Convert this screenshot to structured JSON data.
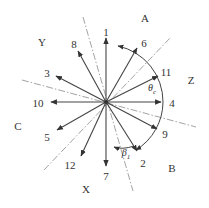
{
  "diagram": {
    "center": [
      106,
      102
    ],
    "colors": {
      "arrow": "#444444",
      "dash": "#999999",
      "text": "#333333"
    },
    "regions": [
      {
        "label": "A",
        "x": 145,
        "y": 18
      },
      {
        "label": "Y",
        "x": 42,
        "y": 42
      },
      {
        "label": "Z",
        "x": 191,
        "y": 80
      },
      {
        "label": "C",
        "x": 18,
        "y": 126
      },
      {
        "label": "B",
        "x": 172,
        "y": 168
      },
      {
        "label": "X",
        "x": 86,
        "y": 189
      }
    ],
    "vectors": [
      {
        "label": "1",
        "tip": [
          106,
          38
        ],
        "lx": 106,
        "ly": 32
      },
      {
        "label": "6",
        "tip": [
          137,
          48
        ],
        "lx": 144,
        "ly": 43
      },
      {
        "label": "11",
        "tip": [
          158,
          76
        ],
        "lx": 166,
        "ly": 72
      },
      {
        "label": "4",
        "tip": [
          161,
          102
        ],
        "lx": 172,
        "ly": 103
      },
      {
        "label": "9",
        "tip": [
          157,
          129
        ],
        "lx": 165,
        "ly": 134
      },
      {
        "label": "2",
        "tip": [
          137,
          151
        ],
        "lx": 143,
        "ly": 163
      },
      {
        "label": "7",
        "tip": [
          106,
          166
        ],
        "lx": 106,
        "ly": 176
      },
      {
        "label": "12",
        "tip": [
          81,
          156
        ],
        "lx": 70,
        "ly": 165
      },
      {
        "label": "5",
        "tip": [
          57,
          130
        ],
        "lx": 47,
        "ly": 137
      },
      {
        "label": "10",
        "tip": [
          51,
          102
        ],
        "lx": 38,
        "ly": 103
      },
      {
        "label": "3",
        "tip": [
          56,
          76
        ],
        "lx": 47,
        "ly": 73
      },
      {
        "label": "8",
        "tip": [
          78,
          51
        ],
        "lx": 74,
        "ly": 44
      }
    ],
    "dash_lines": [
      {
        "from": [
          83,
          17
        ],
        "to": [
          133,
          191
        ]
      },
      {
        "from": [
          22,
          80
        ],
        "to": [
          196,
          127
        ]
      },
      {
        "from": [
          44,
          170
        ],
        "to": [
          171,
          37
        ]
      }
    ],
    "angles": [
      {
        "symbol": "θ",
        "sub": "c",
        "x": 152,
        "y": 89
      },
      {
        "symbol": "β",
        "sub": "1",
        "x": 126,
        "y": 154
      }
    ]
  }
}
